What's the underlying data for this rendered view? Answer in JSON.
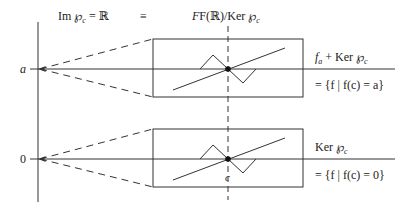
{
  "header": {
    "left_label": "Im ℘",
    "left_sub": "c",
    "left_rhs": " = ℝ",
    "equiv": "≡",
    "right_label_pre": "F(ℝ)/Ker ",
    "right_phi": "℘",
    "right_sub": "c"
  },
  "axis": {
    "tick_a": "a",
    "tick_0": "0"
  },
  "top_box": {
    "label_f": "f",
    "label_f_sub": "a",
    "label_rest": " + Ker ",
    "label_phi": "℘",
    "label_sub": "c",
    "set_text": "= {f | f(c) = a}"
  },
  "bottom_box": {
    "label": "Ker ",
    "label_phi": "℘",
    "label_sub": "c",
    "set_text": "= {f | f(c) = 0}",
    "point_label": "c"
  },
  "colors": {
    "stroke": "#333333",
    "background": "#ffffff"
  }
}
